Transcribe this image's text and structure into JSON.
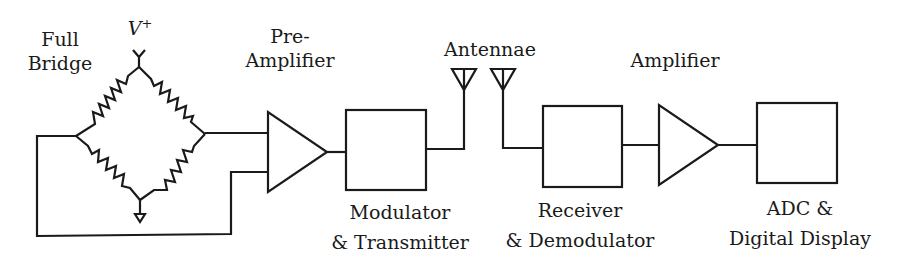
{
  "diagram": {
    "stroke_color": "#1a1a1a",
    "labels": {
      "full_bridge_line1": "Full",
      "full_bridge_line2": "Bridge",
      "supply_symbol": "V",
      "supply_superscript": "+",
      "preamp_line1": "Pre-",
      "preamp_line2": "Amplifier",
      "antennae": "Antennae",
      "amplifier": "Amplifier",
      "modulator_line1": "Modulator",
      "modulator_line2": "& Transmitter",
      "receiver_line1": "Receiver",
      "receiver_line2": "& Demodulator",
      "adc_line1": "ADC &",
      "adc_line2": "Digital Display"
    },
    "blocks": [
      {
        "id": "full-bridge",
        "type": "wheatstone-bridge"
      },
      {
        "id": "pre-amplifier",
        "type": "triangle"
      },
      {
        "id": "modulator-transmitter",
        "type": "box"
      },
      {
        "id": "transmit-antenna",
        "type": "antenna"
      },
      {
        "id": "receive-antenna",
        "type": "antenna"
      },
      {
        "id": "receiver-demodulator",
        "type": "box"
      },
      {
        "id": "amplifier",
        "type": "triangle"
      },
      {
        "id": "adc-display",
        "type": "box"
      }
    ]
  }
}
